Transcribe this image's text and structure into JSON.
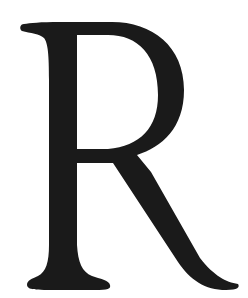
{
  "glyph": {
    "character": "R",
    "fill_color": "#1a1a1a",
    "background_color": "#ffffff"
  }
}
